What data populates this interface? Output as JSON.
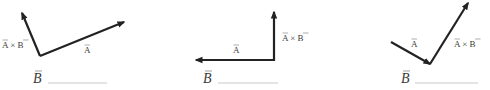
{
  "diagram": {
    "panels": [
      {
        "id": "panel-1",
        "vectors": [
          {
            "name": "cross_product",
            "label": "A×B",
            "from": [
              40,
              56
            ],
            "to": [
              22,
              13
            ]
          },
          {
            "name": "vector_a",
            "label": "A",
            "from": [
              40,
              56
            ],
            "to": [
              124,
              22
            ]
          }
        ],
        "labels": {
          "cross": {
            "text": "A × B",
            "x": 2,
            "y": 48
          },
          "a": {
            "text": "A",
            "x": 84,
            "y": 53
          }
        },
        "answer": {
          "label": "B",
          "x": 33,
          "y": 82,
          "line_x1": 48,
          "line_x2": 107,
          "line_y": 83,
          "value": ""
        }
      },
      {
        "id": "panel-2",
        "vectors": [
          {
            "name": "cross_product",
            "label": "A×B",
            "from": [
              274,
              60
            ],
            "to": [
              274,
              12
            ]
          },
          {
            "name": "vector_a",
            "label": "A",
            "from": [
              274,
              60
            ],
            "to": [
              196,
              60
            ]
          }
        ],
        "labels": {
          "cross": {
            "text": "A × B",
            "x": 282,
            "y": 41
          },
          "a": {
            "text": "A",
            "x": 233,
            "y": 53
          }
        },
        "answer": {
          "label": "B",
          "x": 203,
          "y": 82,
          "line_x1": 218,
          "line_x2": 278,
          "line_y": 83,
          "value": ""
        }
      },
      {
        "id": "panel-3",
        "vectors": [
          {
            "name": "vector_a",
            "label": "A",
            "from": [
              391,
              42
            ],
            "to": [
              430,
              64
            ]
          },
          {
            "name": "cross_product",
            "label": "A×B",
            "from": [
              430,
              64
            ],
            "to": [
              468,
              3
            ]
          }
        ],
        "labels": {
          "cross": {
            "text": "A × B",
            "x": 454,
            "y": 47
          },
          "a": {
            "text": "A",
            "x": 411,
            "y": 47
          }
        },
        "answer": {
          "label": "B",
          "x": 401,
          "y": 82,
          "line_x1": 415,
          "line_x2": 478,
          "line_y": 83,
          "value": ""
        }
      }
    ],
    "colors": {
      "vector": "#222222",
      "label": "#3a3a3a",
      "blank_line": "#c8c8c8",
      "background": "#ffffff"
    }
  }
}
